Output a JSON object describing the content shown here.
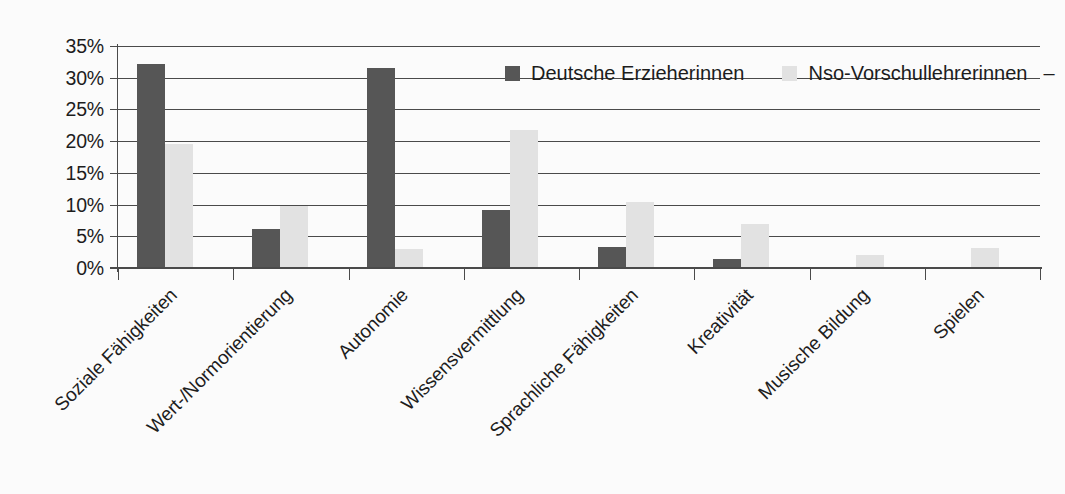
{
  "chart_data": {
    "type": "bar",
    "title": "",
    "subtitle": "",
    "xlabel": "",
    "ylabel": "",
    "categories": [
      "Soziale Fähigkeiten",
      "Wert-/Normorientierung",
      "Autonomie",
      "Wissensvermittlung",
      "Sprachliche Fähigkeiten",
      "Kreativität",
      "Musische Bildung",
      "Spielen"
    ],
    "series": [
      {
        "name": "Deutsche Erzieherinnen",
        "color": "#565656",
        "values": [
          32.2,
          6.2,
          31.5,
          9.2,
          3.3,
          1.4,
          0.0,
          0.0
        ]
      },
      {
        "name": "Nso-Vorschullehrerinnen",
        "color": "#e2e2e2",
        "values": [
          19.5,
          9.8,
          3.0,
          21.7,
          10.4,
          7.0,
          2.0,
          3.2
        ]
      }
    ],
    "ylim": [
      0,
      35
    ],
    "ytick_values": [
      0,
      5,
      10,
      15,
      20,
      25,
      30,
      35
    ],
    "ytick_labels": [
      "0%",
      "5%",
      "10%",
      "15%",
      "20%",
      "25%",
      "30%",
      "35%"
    ],
    "grid": true,
    "grid_axis": "y",
    "legend_position": "top-right-inside",
    "legend_trailing_mark": "–",
    "value_unit": "%"
  }
}
